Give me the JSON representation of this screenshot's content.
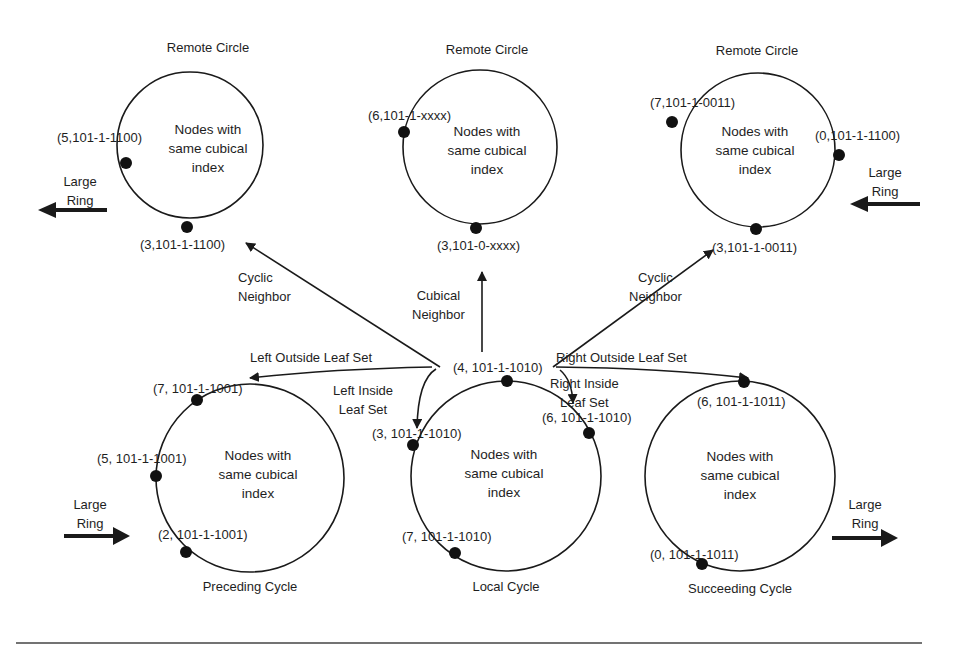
{
  "diagram": {
    "inner_text": {
      "line1": "Nodes with",
      "line2": "same cubical",
      "line3": "index"
    },
    "remote_circles": [
      {
        "title": "Remote Circle",
        "nodes": [
          "(5,101-1-1100)",
          "(3,101-1-1100)"
        ]
      },
      {
        "title": "Remote Circle",
        "nodes": [
          "(6,101-1-xxxx)",
          "(3,101-0-xxxx)"
        ]
      },
      {
        "title": "Remote Circle",
        "nodes": [
          "(7,101-1-0011)",
          "(0,101-1-1100)",
          "(3,101-1-0011)"
        ]
      }
    ],
    "cycles": {
      "preceding": {
        "title": "Preceding Cycle",
        "nodes": [
          "(7, 101-1-1001)",
          "(5, 101-1-1001)",
          "(2, 101-1-1001)"
        ]
      },
      "local": {
        "title": "Local Cycle",
        "center_node": "(4, 101-1-1010)",
        "nodes": [
          "(3, 101-1-1010)",
          "(6, 101-1-1010)",
          "(7, 101-1-1010)"
        ]
      },
      "succeeding": {
        "title": "Succeeding Cycle",
        "nodes": [
          "(6, 101-1-1011)",
          "(0, 101-1-1011)"
        ]
      }
    },
    "edges": {
      "cyclic_left": {
        "line1": "Cyclic",
        "line2": "Neighbor"
      },
      "cubical": {
        "line1": "Cubical",
        "line2": "Neighbor"
      },
      "cyclic_right": {
        "line1": "Cyclic",
        "line2": "Neighbor"
      },
      "left_outside": "Left Outside Leaf Set",
      "right_outside": "Right Outside Leaf Set",
      "left_inside": {
        "line1": "Left Inside",
        "line2": "Leaf Set"
      },
      "right_inside": {
        "line1": "Right Inside",
        "line2": "Leaf Set"
      }
    },
    "large_ring": {
      "line1": "Large",
      "line2": "Ring"
    },
    "colors": {
      "stroke": "#1a1a1a",
      "background": "#ffffff"
    }
  }
}
